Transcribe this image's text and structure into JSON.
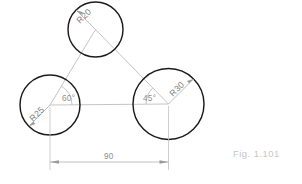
{
  "figure": {
    "caption": "Fig. 1.101",
    "background_color": "#ffffff",
    "outline_color": "#1b1b1b",
    "construction_color": "#b9b9b9",
    "annotation_color": "#8d8d8d",
    "caption_color": "#c6c6c6"
  },
  "circles": [
    {
      "id": "top",
      "label": "R20",
      "radius_value": 20,
      "cx": 95.5,
      "cy": 29.5,
      "r": 27.5
    },
    {
      "id": "left",
      "label": "R25",
      "radius_value": 25,
      "cx": 50,
      "cy": 105,
      "r": 30
    },
    {
      "id": "right",
      "label": "R30",
      "radius_value": 30,
      "cx": 168.5,
      "cy": 104,
      "r": 35.5
    }
  ],
  "angles": [
    {
      "id": "left-angle",
      "label": "60°",
      "value": 60,
      "at": "left-circle-center"
    },
    {
      "id": "right-angle",
      "label": "45°",
      "value": 45,
      "at": "right-circle-center"
    }
  ],
  "dimensions": [
    {
      "id": "baseline-distance",
      "label": "90",
      "value": 90,
      "orientation": "horizontal",
      "from_x": 50,
      "to_x": 168.5,
      "y": 162
    }
  ]
}
